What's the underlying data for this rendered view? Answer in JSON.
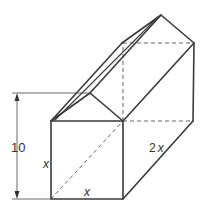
{
  "figure": {
    "labels": {
      "height_dimension": "10",
      "front_side": "x",
      "front_bottom": "x",
      "depth": "2",
      "depth_var": "x"
    },
    "colors": {
      "stroke": "#3a3a3a",
      "background": "#ffffff"
    }
  }
}
